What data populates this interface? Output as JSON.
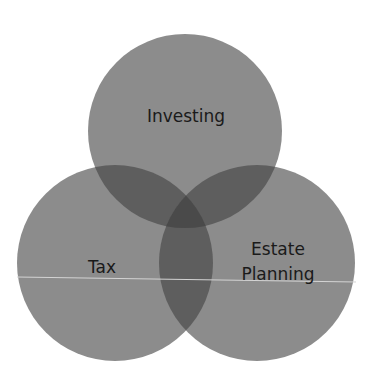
{
  "diagram": {
    "type": "venn",
    "sets": [
      {
        "id": "investing",
        "label": "Investing"
      },
      {
        "id": "tax",
        "label": "Tax"
      },
      {
        "id": "estate",
        "label_line1": "Estate",
        "label_line2": "Planning"
      }
    ],
    "colors": {
      "background": "#ffffff",
      "circle_fill": "#8a8a8a",
      "overlap_tint": "#000000",
      "scan_line": "#d8d8d8",
      "text": "#1a1a1a"
    }
  }
}
